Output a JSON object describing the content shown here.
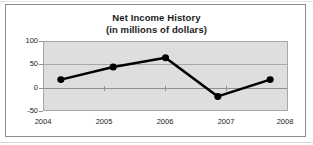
{
  "chart_data": {
    "type": "line",
    "title": "Net Income History",
    "subtitle": "(in millions of dollars)",
    "xlabel": "",
    "ylabel": "",
    "categories": [
      "2004",
      "2005",
      "2006",
      "2007",
      "2008"
    ],
    "values": [
      17,
      45,
      65,
      -20,
      17
    ],
    "series": [
      {
        "name": "Net Income",
        "values": [
          17,
          45,
          65,
          -20,
          17
        ]
      }
    ],
    "ylim": [
      -50,
      100
    ],
    "yticks": [
      "100",
      "50",
      "0",
      "-50"
    ],
    "ytick_values": [
      100,
      50,
      0,
      -50
    ],
    "xticks": [
      "2004",
      "2005",
      "2006",
      "2007",
      "2008"
    ],
    "grid": true,
    "legend": false,
    "legend_position": "none",
    "marker": "circle",
    "colors": {
      "line": "#000000",
      "marker": "#000000",
      "plot_background": "#dedede",
      "figure_background": "#ffffff",
      "gridline": "#a8a8a8",
      "axis": "#8f8f8f",
      "frame": "#8c8c8c",
      "text": "#1a1a1a"
    }
  }
}
